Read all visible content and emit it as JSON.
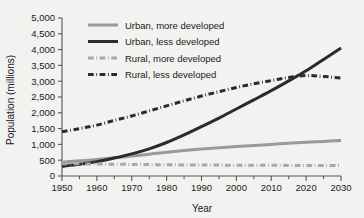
{
  "chart_data": {
    "type": "line",
    "title": "",
    "xlabel": "Year",
    "ylabel": "Population (millions)",
    "xlim": [
      1950,
      2030
    ],
    "ylim": [
      0,
      5000
    ],
    "xticks": [
      1950,
      1960,
      1970,
      1980,
      1990,
      2000,
      2010,
      2020,
      2030
    ],
    "xtick_labels": [
      "1950",
      "1960",
      "1970",
      "1980",
      "1990",
      "2000",
      "2010",
      "2020",
      "2030"
    ],
    "xminor_ticks": [
      1955,
      1965,
      1975,
      1985,
      1995,
      2005,
      2015,
      2025
    ],
    "yticks": [
      0,
      500,
      1000,
      1500,
      2000,
      2500,
      3000,
      3500,
      4000,
      4500,
      5000
    ],
    "ytick_labels": [
      "0",
      "500",
      "1,000",
      "1,500",
      "2,000",
      "2,500",
      "3,000",
      "3,500",
      "4,000",
      "4,500",
      "5,000"
    ],
    "grid": false,
    "legend_position": "upper-left-inside",
    "x": [
      1950,
      1955,
      1960,
      1965,
      1970,
      1975,
      1980,
      1985,
      1990,
      1995,
      2000,
      2005,
      2010,
      2015,
      2020,
      2025,
      2030
    ],
    "series": [
      {
        "name": "Urban, more developed",
        "color": "#9a9a9a",
        "style": "solid",
        "width": 3,
        "values": [
          435,
          480,
          525,
          575,
          630,
          690,
          755,
          810,
          855,
          895,
          930,
          965,
          1000,
          1035,
          1065,
          1095,
          1120
        ]
      },
      {
        "name": "Urban, less developed",
        "color": "#2b2b2b",
        "style": "solid",
        "width": 3,
        "values": [
          310,
          370,
          455,
          570,
          700,
          860,
          1060,
          1300,
          1560,
          1830,
          2120,
          2410,
          2700,
          3010,
          3330,
          3690,
          4050
        ]
      },
      {
        "name": "Rural, more developed",
        "color": "#a8a8a8",
        "style": "dash-dot",
        "width": 3,
        "values": [
          390,
          385,
          378,
          372,
          366,
          360,
          355,
          350,
          348,
          345,
          342,
          340,
          338,
          336,
          334,
          332,
          330
        ]
      },
      {
        "name": "Rural, less developed",
        "color": "#2b2b2b",
        "style": "dash-dot",
        "width": 3,
        "values": [
          1400,
          1500,
          1610,
          1760,
          1900,
          2060,
          2220,
          2380,
          2530,
          2670,
          2800,
          2920,
          3020,
          3120,
          3180,
          3150,
          3100
        ]
      }
    ]
  },
  "legend": {
    "items": [
      {
        "label": "Urban, more developed",
        "color": "#9a9a9a",
        "style": "solid"
      },
      {
        "label": "Urban, less developed",
        "color": "#2b2b2b",
        "style": "solid"
      },
      {
        "label": "Rural, more developed",
        "color": "#a8a8a8",
        "style": "dash-dot"
      },
      {
        "label": "Rural, less developed",
        "color": "#2b2b2b",
        "style": "dash-dot"
      }
    ]
  },
  "colors": {
    "background": "#f2f2f0",
    "axis": "#555555",
    "text": "#1a1a1a"
  }
}
